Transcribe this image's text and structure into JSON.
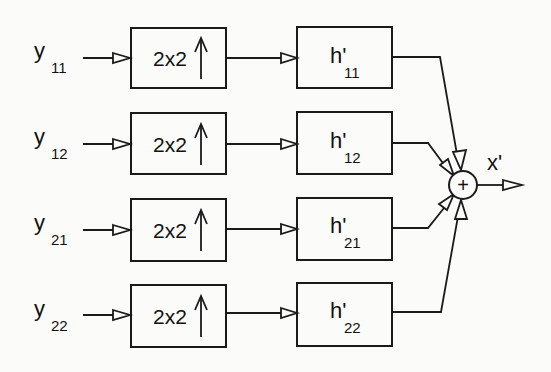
{
  "diagram": {
    "type": "block-diagram",
    "inputs": [
      {
        "base": "y",
        "sub": "11"
      },
      {
        "base": "y",
        "sub": "12"
      },
      {
        "base": "y",
        "sub": "21"
      },
      {
        "base": "y",
        "sub": "22"
      }
    ],
    "upsamplers": [
      {
        "label": "2x2",
        "icon": "up-arrow"
      },
      {
        "label": "2x2",
        "icon": "up-arrow"
      },
      {
        "label": "2x2",
        "icon": "up-arrow"
      },
      {
        "label": "2x2",
        "icon": "up-arrow"
      }
    ],
    "filters": [
      {
        "base": "h'",
        "sub": "11"
      },
      {
        "base": "h'",
        "sub": "12"
      },
      {
        "base": "h'",
        "sub": "21"
      },
      {
        "base": "h'",
        "sub": "22"
      }
    ],
    "summer": {
      "symbol": "+"
    },
    "output": {
      "label": "x'"
    }
  }
}
